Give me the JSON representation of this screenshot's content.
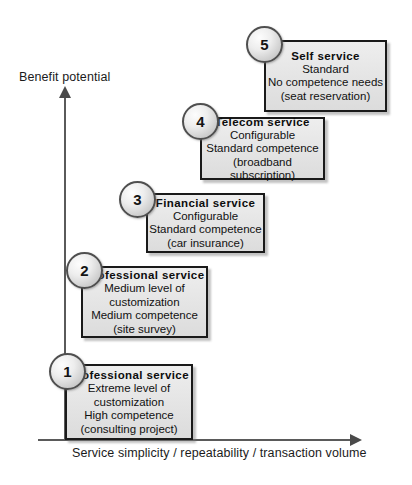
{
  "diagram": {
    "y_axis_label": "Benefit potential",
    "x_axis_label": "Service simplicity / repeatability / transaction volume",
    "colors": {
      "box_fill": "#e6e6e6",
      "box_border": "#1a1a1a",
      "badge_fill": "#e0e0e0",
      "badge_border": "#4f4f4f",
      "axis": "#5a5a5a",
      "text": "#111111",
      "background": "#ffffff"
    },
    "steps": [
      {
        "number": "1",
        "title": "Professional service",
        "lines": [
          "Extreme level of",
          "customization",
          "High competence",
          "(consulting project)"
        ]
      },
      {
        "number": "2",
        "title": "Professional service",
        "lines": [
          "Medium level of",
          "customization",
          "Medium competence",
          "(site survey)"
        ]
      },
      {
        "number": "3",
        "title": "Financial service",
        "lines": [
          "Configurable",
          "Standard competence",
          "(car insurance)"
        ]
      },
      {
        "number": "4",
        "title": "Telecom service",
        "lines": [
          "Configurable",
          "Standard competence",
          "(broadband",
          "subscription)"
        ]
      },
      {
        "number": "5",
        "title": "Self  service",
        "lines": [
          "Standard",
          "No competence needs",
          "(seat reservation)"
        ]
      }
    ]
  }
}
